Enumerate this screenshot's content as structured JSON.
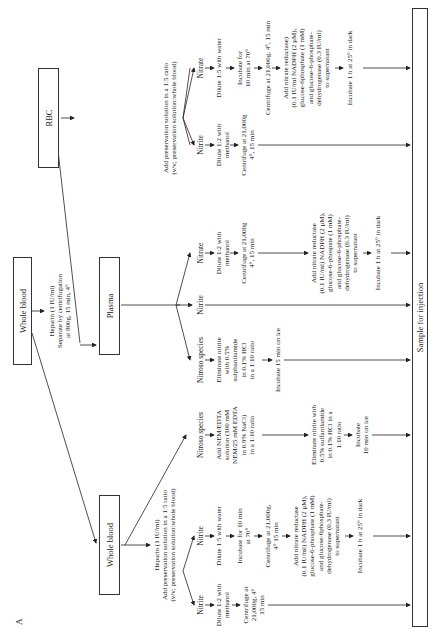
{
  "panel_label": "A",
  "root": {
    "title": "Whole blood",
    "treatment": [
      "Heparin (1 IU/ml)",
      "Separate by centrifugation",
      "at 800g, 15 min, 4°"
    ]
  },
  "branches": {
    "whole_blood": {
      "title": "Whole blood",
      "treatment": [
        "Heparin (1 IU/ml)",
        "Add preservation solution in a 1:5 ratio",
        "(v/v; preservation solution:whole blood)"
      ],
      "lanes": [
        {
          "label": "Nitrite",
          "steps": [
            [
              "Dilute 1:2 with",
              "methanol"
            ],
            [
              "Centrifuge at",
              "21,000g, 4°",
              "15 min"
            ]
          ]
        },
        {
          "label": "Nitrite",
          "steps": [
            [
              "Dilute 1:5 with water"
            ],
            [
              "Incubate for 10 min",
              "at 70°"
            ],
            [
              "Centrifuge at 21,000g,",
              "4° 15 min"
            ],
            [
              "Add nitrate reductase",
              "(0.1 IU/ml) NADPH (2 μM),",
              "glucose-6-phosphate (1 mM)",
              "and glucose-6phosphate-",
              "dehydrogenase (0.3 IU/ml)",
              "to supernatant"
            ],
            [
              "Incubate 1 h at 25° in dark"
            ]
          ]
        },
        {
          "label": "Nitroso species",
          "steps": [
            [
              "Add NEM/EDTA",
              "solution (100 mM",
              "NEM/25 mM EDTA",
              "in 0.9% NaCl)",
              "in a 1:10 ratio"
            ],
            [
              "Eliminate nitrite with",
              "0.5% sulfanilamide",
              "in 0.1% HCl in a",
              "1:10 ratio"
            ],
            [
              "Incubate",
              "10 min on ice"
            ]
          ]
        }
      ]
    },
    "plasma": {
      "title": "Plasma",
      "lanes": [
        {
          "label": "Nitroso species",
          "steps": [
            [
              "Eliminate nitrite",
              "with 0.5%",
              "sulphanilamide",
              "in 0.1% HCl",
              "in a 1:10 ratio"
            ],
            [
              "Incubate 15 min on ice"
            ]
          ]
        },
        {
          "label": "Nitrite",
          "steps": []
        },
        {
          "label": "Nitrate",
          "steps": [
            [
              "Dilute 1:2 with",
              "methanol"
            ],
            [
              "Centrifuge at 21,000g",
              "4°, 15 min"
            ],
            [
              "Add nitrate reductase",
              "(0.1 IU/ml) NADPH (2 μM),",
              "glucose-6-phospate (1 mM)",
              "and glucose-6-phosphate-",
              "dehydrogenase (0.3 IU/ml)",
              "to supernatant"
            ],
            [
              "Incubate 1 h at 25° in dark"
            ]
          ]
        }
      ]
    },
    "rbc": {
      "title": "RBC",
      "treatment": [
        "Add preservation solution in a 1:5 ratio",
        "(v/v; preservation solution:whole blood)"
      ],
      "lanes": [
        {
          "label": "Nitrite",
          "steps": [
            [
              "Dilute 1:2 with",
              "methanol"
            ],
            [
              "Centrifuge at 21,000g",
              "4°, 15 min"
            ]
          ]
        },
        {
          "label": "Nitrate",
          "steps": [
            [
              "Dilute 1:5 with water"
            ],
            [
              "Incubate for",
              "10 min at 70°"
            ],
            [
              "Centrifuge at 21,000g, 4°, 15 min"
            ],
            [
              "Add nitrate reductase)",
              "(0.1 IU/ml NADPH (2 μM),",
              "glucose-6phosphate (1 mM)",
              "and glucose-6-phosphate-",
              "dehydrogenase (0.3 IU/ml)",
              "to supernatant"
            ],
            [
              "Incubate 1 h at 25° in dark"
            ]
          ]
        }
      ]
    }
  },
  "sink": {
    "title": "Sample for injection"
  },
  "colors": {
    "line": "#222222",
    "box_border": "#333333",
    "text": "#1a1a1a"
  }
}
